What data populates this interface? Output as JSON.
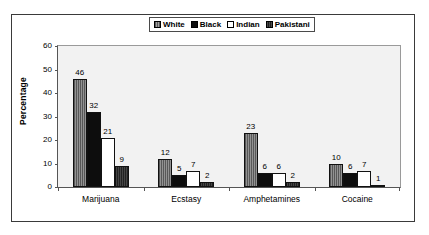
{
  "chart_data": {
    "type": "bar",
    "title": "",
    "subtitle": "",
    "xlabel": "",
    "ylabel": "Percentage",
    "categories": [
      "Marijuana",
      "Ecstasy",
      "Amphetamines",
      "Cocaine"
    ],
    "series": [
      {
        "name": "White",
        "values": [
          46,
          12,
          23,
          10
        ],
        "color": "#7d7d7d",
        "pattern": "vertical-hatch-gray"
      },
      {
        "name": "Black",
        "values": [
          32,
          5,
          6,
          6
        ],
        "color": "#0d0d0d",
        "pattern": "solid-black"
      },
      {
        "name": "Indian",
        "values": [
          21,
          7,
          6,
          7
        ],
        "color": "#ffffff",
        "pattern": "solid-white"
      },
      {
        "name": "Pakistani",
        "values": [
          9,
          2,
          2,
          1
        ],
        "color": "#2b2b2b",
        "pattern": "dark-hatch"
      }
    ],
    "ylim": [
      0,
      60
    ],
    "yticks": [
      0,
      10,
      20,
      30,
      40,
      50,
      60
    ],
    "ytick_labels": [
      "0",
      "10",
      "20",
      "30",
      "40",
      "50",
      "60"
    ],
    "grid": false,
    "data_labels": true,
    "legend_position": "top-center",
    "legend_boxed": true,
    "plot_background": "#f2f2f2",
    "figure_background": "#ffffff",
    "frame_border": "#3a3a3a"
  }
}
